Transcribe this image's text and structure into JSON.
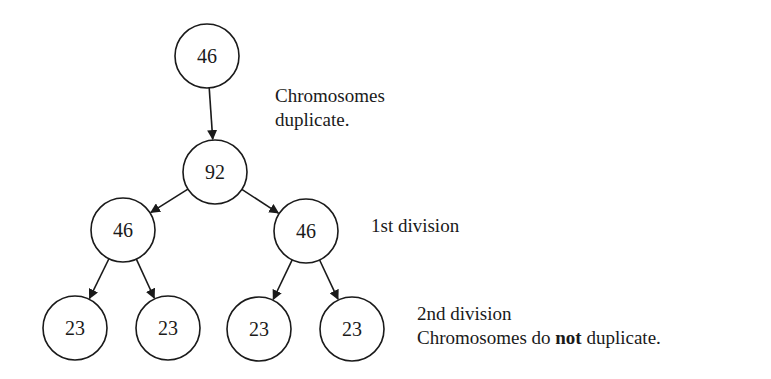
{
  "diagram": {
    "nodes": [
      {
        "id": "root",
        "value": "46",
        "cx": 207,
        "cy": 56,
        "r": 32
      },
      {
        "id": "duplicated",
        "value": "92",
        "cx": 215,
        "cy": 172,
        "r": 32
      },
      {
        "id": "div1-left",
        "value": "46",
        "cx": 123,
        "cy": 230,
        "r": 32
      },
      {
        "id": "div1-right",
        "value": "46",
        "cx": 306,
        "cy": 231,
        "r": 32
      },
      {
        "id": "div2-a",
        "value": "23",
        "cx": 75,
        "cy": 328,
        "r": 32
      },
      {
        "id": "div2-b",
        "value": "23",
        "cx": 168,
        "cy": 328,
        "r": 32
      },
      {
        "id": "div2-c",
        "value": "23",
        "cx": 259,
        "cy": 329,
        "r": 32
      },
      {
        "id": "div2-d",
        "value": "23",
        "cx": 352,
        "cy": 329,
        "r": 32
      }
    ],
    "edges": [
      {
        "from": "root",
        "to": "duplicated"
      },
      {
        "from": "duplicated",
        "to": "div1-left"
      },
      {
        "from": "duplicated",
        "to": "div1-right"
      },
      {
        "from": "div1-left",
        "to": "div2-a"
      },
      {
        "from": "div1-left",
        "to": "div2-b"
      },
      {
        "from": "div1-right",
        "to": "div2-c"
      },
      {
        "from": "div1-right",
        "to": "div2-d"
      }
    ],
    "annotations": {
      "duplicate_line1": "Chromosomes",
      "duplicate_line2": "duplicate.",
      "first_division": "1st division",
      "second_division": "2nd division",
      "no_dup_prefix": "Chromosomes do ",
      "no_dup_bold": "not",
      "no_dup_suffix": " duplicate."
    }
  }
}
